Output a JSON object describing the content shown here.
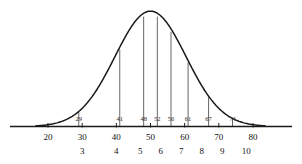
{
  "chart_data": {
    "type": "line",
    "title": "",
    "xlabel": "",
    "ylabel": "",
    "xlim": [
      14,
      86
    ],
    "ylim": [
      0,
      1
    ],
    "grid": false,
    "legend": null,
    "curve": {
      "name": "normal-distribution-curve",
      "shape": "bell",
      "mean": 50,
      "baseline_start": 20,
      "baseline_end": 80,
      "peak_x": 50
    },
    "ordinates": [
      {
        "x": 29,
        "label": "29",
        "height": 0.13
      },
      {
        "x": 41,
        "label": "41",
        "height": 0.58
      },
      {
        "x": 48,
        "label": "48",
        "height": 0.96
      },
      {
        "x": 52,
        "label": "52",
        "height": 0.97
      },
      {
        "x": 56,
        "label": "56",
        "height": 0.79
      },
      {
        "x": 61,
        "label": "61",
        "height": 0.52
      },
      {
        "x": 67,
        "label": "67",
        "height": 0.24
      },
      {
        "x": 74,
        "label": "74",
        "height": 0.08
      }
    ],
    "axis_ticks": [
      {
        "x": 20,
        "label": "20"
      },
      {
        "x": 30,
        "label": "30"
      },
      {
        "x": 40,
        "label": "40"
      },
      {
        "x": 50,
        "label": "50"
      },
      {
        "x": 60,
        "label": "60"
      },
      {
        "x": 70,
        "label": "70"
      },
      {
        "x": 80,
        "label": "80"
      }
    ],
    "index_labels": [
      {
        "x": 30,
        "label": "3"
      },
      {
        "x": 40,
        "label": "4"
      },
      {
        "x": 47,
        "label": "5"
      },
      {
        "x": 53,
        "label": "6"
      },
      {
        "x": 59,
        "label": "7"
      },
      {
        "x": 65,
        "label": "8"
      },
      {
        "x": 71,
        "label": "9"
      },
      {
        "x": 78,
        "label": "10"
      }
    ],
    "colors": {
      "curve": "#1a1a1a",
      "axis": "#1a1a1a",
      "ordinate": "#555555",
      "background": "#ffffff"
    }
  }
}
